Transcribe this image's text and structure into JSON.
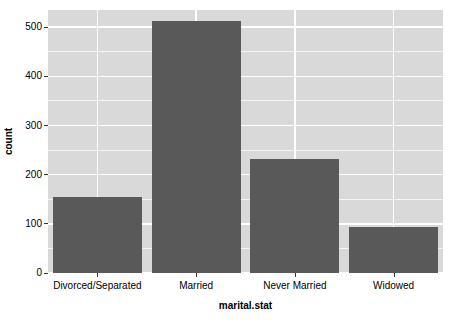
{
  "chart_data": {
    "type": "bar",
    "title": "",
    "subtitle": "",
    "xlabel": "marital.stat",
    "ylabel": "count",
    "categories": [
      "Divorced/Separated",
      "Married",
      "Never Married",
      "Widowed"
    ],
    "values": [
      155,
      512,
      232,
      93
    ],
    "ylim": [
      0,
      535
    ],
    "xlim": [
      0,
      4
    ],
    "y_ticks": [
      0,
      100,
      200,
      300,
      400,
      500
    ],
    "y_tick_labels": [
      "0",
      "100",
      "200",
      "300",
      "400",
      "500"
    ],
    "y_minor_ticks": [
      50,
      150,
      250,
      350,
      450
    ],
    "grid": true,
    "grid_color": "#ffffff",
    "legend": false,
    "legend_position": "none",
    "bar_color": "#595959",
    "panel_background": "#d9d9d9",
    "plot_background": "#ffffff",
    "axis_text_color": "#000000",
    "style": "ggplot2-grey"
  },
  "axes": {
    "y_title": "count",
    "x_title": "marital.stat"
  }
}
